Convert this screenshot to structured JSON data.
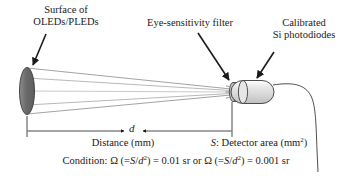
{
  "figure": {
    "labels": {
      "surface_line1": "Surface of",
      "surface_line2": "OLEDs/PLEDs",
      "filter": "Eye-sensitivity filter",
      "photodiodes_line1": "Calibrated",
      "photodiodes_line2": "Si photodiodes",
      "distance": "Distance (mm)",
      "distance_symbol": "d"
    },
    "detector_area": {
      "symbol": "S",
      "text_before": ": Detector area (mm",
      "exponent": "2",
      "text_after": ")"
    },
    "condition": {
      "prefix": "Condition: ",
      "omega": "Ω",
      "open_paren": " (=",
      "numerator": "S",
      "slash": "/",
      "denominator": "d",
      "exponent": "2",
      "close_paren": ") = ",
      "value1": "0.01 sr",
      "conjunction": " or ",
      "value2": "0.001 sr"
    },
    "colors": {
      "ink": "#1a1a1a",
      "oled_surface_fill": "#6f6f6f",
      "detector_body_fill": "#dcdcdc",
      "filter_fill": "#c9c9c9",
      "beam_line": "#8a8a8a",
      "background": "#ffffff"
    }
  }
}
